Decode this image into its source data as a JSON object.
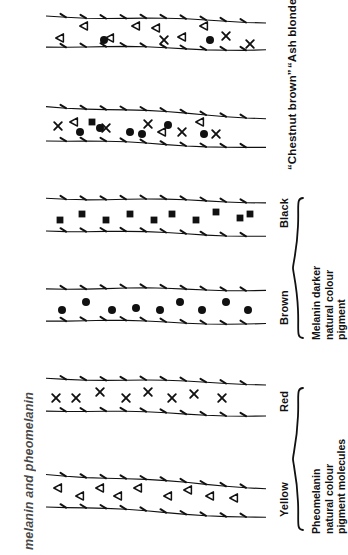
{
  "figure": {
    "caption": "melanin and pheomelanin",
    "orientation": "rotated-90",
    "background": "#ffffff",
    "ink": "#111111"
  },
  "chart_data": {
    "type": "diagram",
    "title": "melanin and pheomelanin",
    "symbol_legend": [
      {
        "key": "triangle",
        "glyph": "open left-pointing triangle",
        "meaning": "yellow pheomelanin pigment molecule"
      },
      {
        "key": "cross",
        "glyph": "x",
        "meaning": "red pheomelanin pigment molecule"
      },
      {
        "key": "circle",
        "glyph": "filled circle",
        "meaning": "brown melanin pigment granule"
      },
      {
        "key": "square",
        "glyph": "filled square",
        "meaning": "black melanin pigment granule"
      }
    ],
    "strands": [
      {
        "label": "“Ash blonde”",
        "quoted": true,
        "group": null,
        "symbols": [
          "triangle",
          "triangle",
          "triangle",
          "triangle",
          "triangle",
          "triangle",
          "triangle",
          "cross",
          "cross",
          "cross",
          "circle",
          "circle"
        ],
        "counts": {
          "triangle": 7,
          "cross": 3,
          "circle": 2,
          "square": 0
        }
      },
      {
        "label": "“Chestnut brown”",
        "quoted": true,
        "group": null,
        "symbols": [
          "circle",
          "circle",
          "circle",
          "circle",
          "circle",
          "circle",
          "cross",
          "cross",
          "cross",
          "cross",
          "cross",
          "triangle",
          "triangle",
          "triangle",
          "square"
        ],
        "counts": {
          "triangle": 3,
          "cross": 5,
          "circle": 6,
          "square": 1
        }
      },
      {
        "label": "Black",
        "quoted": false,
        "group": "melanin",
        "symbols": [
          "square",
          "square",
          "square",
          "square",
          "square",
          "square",
          "square",
          "square",
          "square",
          "square"
        ],
        "counts": {
          "triangle": 0,
          "cross": 0,
          "circle": 0,
          "square": 10
        }
      },
      {
        "label": "Brown",
        "quoted": false,
        "group": "melanin",
        "symbols": [
          "circle",
          "circle",
          "circle",
          "circle",
          "circle",
          "circle",
          "circle",
          "circle",
          "circle"
        ],
        "counts": {
          "triangle": 0,
          "cross": 0,
          "circle": 9,
          "square": 0
        }
      },
      {
        "label": "Red",
        "quoted": false,
        "group": "pheomelanin",
        "symbols": [
          "cross",
          "cross",
          "cross",
          "cross",
          "cross",
          "cross",
          "cross",
          "cross"
        ],
        "counts": {
          "triangle": 0,
          "cross": 8,
          "circle": 0,
          "square": 0
        }
      },
      {
        "label": "Yellow",
        "quoted": false,
        "group": "pheomelanin",
        "symbols": [
          "triangle",
          "triangle",
          "triangle",
          "triangle",
          "triangle",
          "triangle",
          "triangle",
          "triangle",
          "triangle"
        ],
        "counts": {
          "triangle": 9,
          "cross": 0,
          "circle": 0,
          "square": 0
        }
      }
    ],
    "groups": [
      {
        "id": "melanin",
        "lines": [
          "Melanin darker",
          "natural colour",
          "pigment"
        ],
        "covers": [
          "Brown",
          "Black"
        ]
      },
      {
        "id": "pheomelanin",
        "lines": [
          "Pheomelanin",
          "natural colour",
          "pigment molecules"
        ],
        "covers": [
          "Yellow",
          "Red"
        ]
      }
    ]
  },
  "labels": {
    "ash_blonde": "“Ash blonde”",
    "chestnut_brown": "“Chestnut brown”",
    "black": "Black",
    "brown": "Brown",
    "red": "Red",
    "yellow": "Yellow"
  },
  "groups": {
    "melanin": {
      "line1": "Melanin darker",
      "line2": "natural colour",
      "line3": "pigment"
    },
    "pheomelanin": {
      "line1": "Pheomelanin",
      "line2": "natural colour",
      "line3": "pigment molecules"
    }
  }
}
